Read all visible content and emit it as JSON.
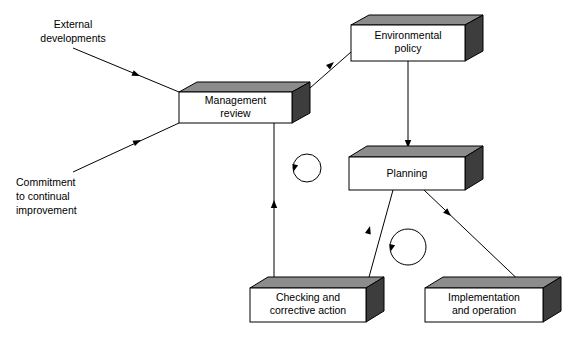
{
  "diagram": {
    "colors": {
      "box_front": "#ffffff",
      "box_top": "#8c8c8c",
      "box_side": "#3d3d3d",
      "line": "#000000",
      "background": "#ffffff"
    },
    "nodes": [
      {
        "id": "management-review",
        "label_lines": [
          "Management",
          "review"
        ],
        "line1": "Management",
        "line2": "review",
        "front": {
          "x": 179,
          "y": 92,
          "w": 113,
          "h": 31
        },
        "depth_x": 18,
        "depth_y": 10
      },
      {
        "id": "environmental-policy",
        "label_lines": [
          "Environmental",
          "policy"
        ],
        "line1": "Environmental",
        "line2": "policy",
        "front": {
          "x": 351,
          "y": 25,
          "w": 114,
          "h": 36
        },
        "depth_x": 18,
        "depth_y": 10
      },
      {
        "id": "planning",
        "label_lines": [
          "Planning"
        ],
        "line1": "Planning",
        "line2": "",
        "front": {
          "x": 349,
          "y": 157,
          "w": 116,
          "h": 33
        },
        "depth_x": 18,
        "depth_y": 11
      },
      {
        "id": "checking-and-corrective-action",
        "label_lines": [
          "Checking and",
          "corrective action"
        ],
        "line1": "Checking and",
        "line2": "corrective action",
        "front": {
          "x": 250,
          "y": 288,
          "w": 116,
          "h": 34
        },
        "depth_x": 18,
        "depth_y": 11
      },
      {
        "id": "implementation-and-operation",
        "label_lines": [
          "Implementation",
          "and operation"
        ],
        "line1": "Implementation",
        "line2": "and operation",
        "front": {
          "x": 425,
          "y": 288,
          "w": 118,
          "h": 34
        },
        "depth_x": 18,
        "depth_y": 11
      }
    ],
    "free_labels": [
      {
        "id": "external-developments",
        "lines": [
          "External",
          "developments"
        ],
        "line1": "External",
        "line2": "developments",
        "x": 60,
        "y": 22
      },
      {
        "id": "commitment-to-continual-improvement",
        "lines": [
          "Commitment",
          "to continual",
          "improvement"
        ],
        "line1": "Commitment",
        "line2": "to continual",
        "line3": "improvement",
        "x": 16,
        "y": 182
      }
    ],
    "connectors": [
      {
        "id": "external-developments-to-management-review",
        "from": "external-developments",
        "to": "management-review",
        "path": "M 73,48 L 179,92",
        "arrow_at": {
          "x": 138,
          "y": 75,
          "angle": 22.5
        }
      },
      {
        "id": "commitment-to-management-review",
        "from": "commitment-to-continual-improvement",
        "to": "management-review",
        "path": "M 73,172 L 179,123",
        "arrow_at": {
          "x": 139,
          "y": 141,
          "angle": -24.8
        }
      },
      {
        "id": "management-review-to-environmental-policy",
        "from": "management-review",
        "to": "environmental-policy",
        "path": "M 310,88 L 351,52",
        "arrow_at": {
          "x": 333,
          "y": 63,
          "angle": -41.3
        }
      },
      {
        "id": "environmental-policy-to-planning",
        "from": "environmental-policy",
        "to": "planning",
        "path": "M 408,61 L 408,147",
        "arrow_at": {
          "x": 408,
          "y": 147,
          "angle": 90
        }
      },
      {
        "id": "planning-to-implementation-and-operation",
        "from": "planning",
        "to": "implementation-and-operation",
        "path": "M 424,190 L 527,288",
        "arrow_at": {
          "x": 449,
          "y": 214,
          "angle": 43.6
        }
      },
      {
        "id": "checking-and-corrective-action-to-planning",
        "from": "checking-and-corrective-action",
        "to": "planning",
        "path": "M 366,288 L 393,190",
        "arrow_at": {
          "x": 371,
          "y": 227,
          "angle": -74.6
        }
      },
      {
        "id": "checking-and-corrective-action-to-management-review",
        "from": "checking-and-corrective-action",
        "to": "management-review",
        "path": "M 274,288 L 274,123",
        "arrow_at": {
          "x": 274,
          "y": 201,
          "angle": -90
        }
      }
    ],
    "cycle_arrows": [
      {
        "id": "cycle-arrow-upper",
        "cx": 307,
        "cy": 168,
        "r": 14,
        "arrow_at": {
          "x": 293,
          "y": 170,
          "angle": 100
        }
      },
      {
        "id": "cycle-arrow-lower",
        "cx": 408,
        "cy": 247,
        "r": 18,
        "arrow_at": {
          "x": 390,
          "y": 250,
          "angle": 100
        }
      }
    ]
  }
}
